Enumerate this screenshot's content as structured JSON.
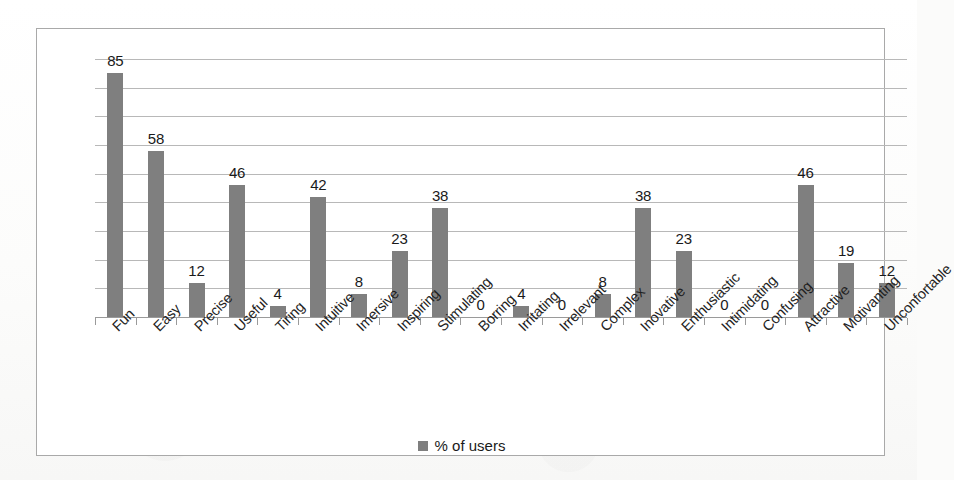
{
  "chart_data": {
    "type": "bar",
    "title": "",
    "subtitle": "",
    "xlabel": "",
    "ylabel": "",
    "ylim": [
      0,
      90
    ],
    "grid": true,
    "gridline_step": 10,
    "gridline_count": 9,
    "legend_position": "bottom",
    "bar_color": "#7f7f7f",
    "categories": [
      "Fun",
      "Easy",
      "Precise",
      "Useful",
      "Tiring",
      "Intuitive",
      "Imersive",
      "Inspiring",
      "Stimulating",
      "Borring",
      "Irritating",
      "Irrelevant",
      "Complex",
      "Inovative",
      "Enthusiastic",
      "Intimidating",
      "Confusing",
      "Attractive",
      "Motivanting",
      "Unconfortable"
    ],
    "series": [
      {
        "name": "% of users",
        "values": [
          85,
          58,
          12,
          46,
          4,
          42,
          8,
          23,
          38,
          0,
          4,
          0,
          8,
          38,
          23,
          0,
          0,
          46,
          19,
          12
        ]
      }
    ],
    "data_labels": [
      "85",
      "58",
      "12",
      "46",
      "4",
      "42",
      "8",
      "23",
      "38",
      "0",
      "4",
      "0",
      "8",
      "38",
      "23",
      "0",
      "0",
      "46",
      "19",
      "12"
    ]
  },
  "legend": {
    "entries": [
      {
        "label": "% of users",
        "color": "#7f7f7f",
        "marker": "square"
      }
    ]
  },
  "colors": {
    "bar": "#7f7f7f",
    "gridline": "#b8b8b8",
    "axis": "#9a9a9a",
    "border": "#a9a9a9",
    "text": "#1a1a1a",
    "background": "#ffffff"
  }
}
